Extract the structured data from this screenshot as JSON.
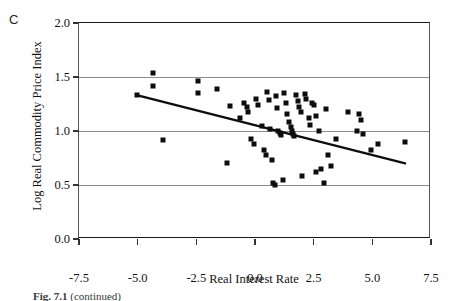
{
  "panel": {
    "label": "C"
  },
  "caption": {
    "prefix": "Fig. 7.1",
    "text": "(continued)"
  },
  "chart_data": {
    "type": "scatter",
    "title": "",
    "xlabel": "Real Interest Rate",
    "ylabel": "Log Real Commodity Price Index",
    "xlim": [
      -7.5,
      7.5
    ],
    "ylim": [
      0.0,
      2.0
    ],
    "xticks": [
      -7.5,
      -5.0,
      -2.5,
      0.0,
      2.5,
      5.0,
      7.5
    ],
    "yticks": [
      0.0,
      0.5,
      1.0,
      1.5,
      2.0
    ],
    "xtick_labels": [
      "-7.5",
      "-5.0",
      "-2.5",
      "0.0",
      "2.5",
      "5.0",
      "7.5"
    ],
    "ytick_labels": [
      "0.0",
      "0.5",
      "1.0",
      "1.5",
      "2.0"
    ],
    "grid": true,
    "grid_axis": "y",
    "gridlines_at": [
      0.5,
      1.0,
      1.5,
      2.0
    ],
    "marker": "square",
    "marker_color": "#0d0d0d",
    "legend": null,
    "series": [
      {
        "name": "observations",
        "x": [
          -5.02,
          -4.35,
          -4.35,
          -3.92,
          -2.42,
          -2.42,
          -1.62,
          -1.18,
          -1.05,
          -0.62,
          -0.48,
          -0.32,
          -0.28,
          -0.18,
          -0.05,
          0.05,
          0.12,
          0.28,
          0.38,
          0.45,
          0.52,
          0.58,
          0.62,
          0.72,
          0.78,
          0.85,
          0.88,
          0.92,
          0.98,
          1.05,
          1.12,
          1.18,
          1.25,
          1.32,
          1.38,
          1.45,
          1.52,
          1.58,
          1.62,
          1.68,
          1.75,
          1.82,
          1.88,
          1.95,
          2.02,
          2.12,
          2.18,
          2.28,
          2.35,
          2.45,
          2.52,
          2.58,
          2.62,
          2.72,
          2.82,
          2.92,
          3.02,
          3.12,
          3.25,
          3.45,
          3.95,
          4.35,
          4.45,
          4.52,
          4.62,
          4.95,
          5.25,
          6.38
        ],
        "y": [
          1.33,
          1.54,
          1.42,
          0.92,
          1.46,
          1.35,
          1.39,
          0.7,
          1.23,
          1.12,
          1.26,
          1.22,
          1.18,
          0.93,
          0.88,
          1.3,
          1.24,
          1.05,
          0.82,
          0.78,
          1.36,
          1.29,
          1.02,
          0.73,
          0.52,
          0.5,
          1.32,
          1.21,
          1.0,
          0.98,
          0.96,
          0.55,
          1.35,
          1.26,
          1.16,
          1.08,
          1.04,
          1.0,
          0.97,
          0.95,
          1.33,
          1.28,
          1.22,
          1.18,
          0.58,
          1.34,
          1.3,
          1.12,
          1.06,
          1.26,
          1.24,
          1.14,
          0.62,
          1.0,
          0.65,
          0.52,
          1.2,
          0.78,
          0.68,
          0.93,
          1.18,
          1.0,
          1.16,
          1.1,
          0.97,
          0.82,
          0.88,
          0.9
        ]
      }
    ],
    "trendline": {
      "type": "linear-fit",
      "color": "#0d0d0d",
      "x": [
        -5.0,
        6.4
      ],
      "y": [
        1.33,
        0.7
      ]
    }
  }
}
